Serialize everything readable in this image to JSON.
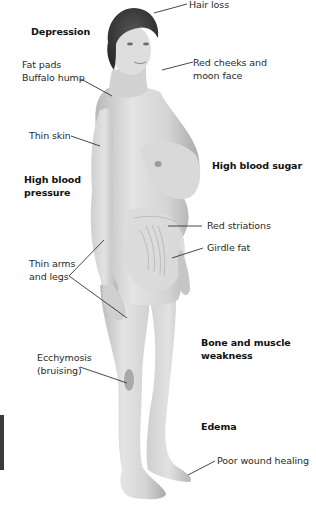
{
  "diagram": {
    "type": "anatomical-label-diagram",
    "colors": {
      "background": "#ffffff",
      "label_text": "#2a2a2a",
      "leader_line": "#333333",
      "skin_light": "#dcdcdc",
      "skin_shadow": "#a8a8a8",
      "hair": "#3a3a3a"
    },
    "labels": {
      "depression": "Depression",
      "fat_pads_line1": "Fat pads",
      "fat_pads_line2": "Buffalo hump",
      "hair_loss": "Hair loss",
      "red_cheeks_line1": "Red cheeks and",
      "red_cheeks_line2": "moon face",
      "thin_skin": "Thin skin",
      "high_bp_line1": "High blood",
      "high_bp_line2": "pressure",
      "high_blood_sugar": "High blood sugar",
      "red_striations": "Red striations",
      "girdle_fat": "Girdle fat",
      "thin_arms_line1": "Thin arms",
      "thin_arms_line2": "and legs",
      "bone_muscle_line1": "Bone and muscle",
      "bone_muscle_line2": "weakness",
      "ecchymosis_line1": "Ecchymosis",
      "ecchymosis_line2": "(bruising)",
      "edema": "Edema",
      "poor_wound_healing": "Poor wound healing"
    }
  }
}
